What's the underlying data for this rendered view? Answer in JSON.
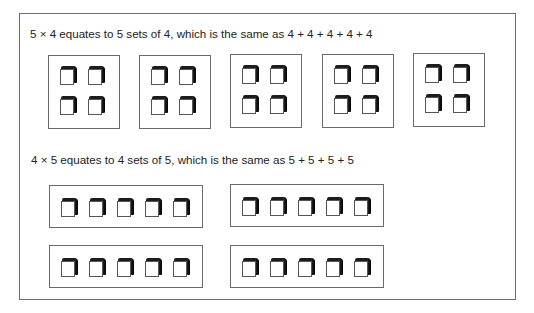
{
  "section_1": {
    "caption": "5 × 4 equates to 5 sets of 4, which is the same as 4 + 4 + 4 + 4 + 4",
    "sets": 5,
    "cubes_per_set": 4,
    "layout": "2x2 grid"
  },
  "section_2": {
    "caption": "4 × 5 equates to 4 sets of 5, which is the same as 5 + 5 + 5 + 5",
    "sets": 4,
    "cubes_per_set": 5,
    "layout": "1x5 row"
  },
  "icons": {
    "cube": "3d-cube-icon"
  },
  "colors": {
    "border": "#6a6a6a",
    "cube_shadow": "#1c1c1c",
    "background": "#ffffff"
  }
}
